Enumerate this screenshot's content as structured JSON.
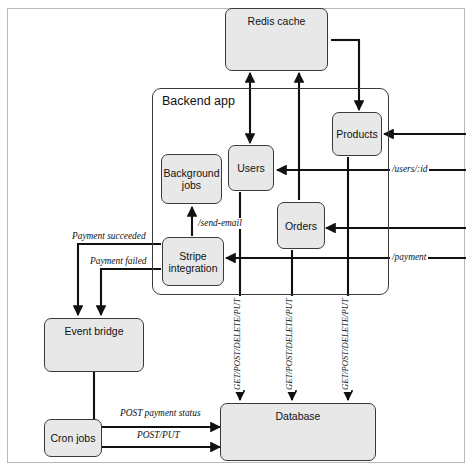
{
  "diagram": {
    "type": "architecture-flow-diagram",
    "colors": {
      "node_fill": "#e8e8e8",
      "node_stroke": "#3a3a3a",
      "edge_stroke": "#111111",
      "frame_stroke": "#b9b9b9",
      "background": "#ffffff"
    },
    "group": {
      "label": "Backend app"
    },
    "nodes": [
      {
        "id": "redis",
        "label": "Redis cache"
      },
      {
        "id": "products",
        "label": "Products"
      },
      {
        "id": "users",
        "label": "Users"
      },
      {
        "id": "orders",
        "label": "Orders"
      },
      {
        "id": "background",
        "label": "Background\njobs",
        "line1": "Background",
        "line2": "jobs"
      },
      {
        "id": "stripe",
        "label": "Stripe\nintegration",
        "line1": "Stripe",
        "line2": "integration"
      },
      {
        "id": "eventbridge",
        "label": "Event bridge"
      },
      {
        "id": "cron",
        "label": "Cron jobs"
      },
      {
        "id": "database",
        "label": "Database"
      }
    ],
    "edge_labels": {
      "users_id": "/users/:id",
      "payment": "/payment",
      "send_email": "/send-email",
      "payment_succeeded": "Payment succeeded",
      "payment_failed": "Payment failed",
      "post_payment_status": "POST payment status",
      "post_put": "POST/PUT",
      "crud_users": "GET/POST/DELETE/PUT",
      "crud_orders": "GET/POST/DELETE/PUT",
      "crud_products": "GET/POST/DELETE/PUT"
    },
    "edges": [
      {
        "from": "redis",
        "to": "users",
        "label": "",
        "bidirectional": true
      },
      {
        "from": "orders",
        "to": "redis",
        "label": "",
        "bidirectional": false
      },
      {
        "from": "redis",
        "to": "products",
        "label": "",
        "bidirectional": false
      },
      {
        "from": "products",
        "to": "redis",
        "label": "",
        "bidirectional": false
      },
      {
        "from": "external",
        "to": "products",
        "label": "",
        "bidirectional": false
      },
      {
        "from": "external",
        "to": "users",
        "label": "/users/:id",
        "bidirectional": false
      },
      {
        "from": "external",
        "to": "orders",
        "label": "",
        "bidirectional": false
      },
      {
        "from": "external",
        "to": "stripe",
        "label": "/payment",
        "bidirectional": false
      },
      {
        "from": "stripe",
        "to": "background",
        "label": "/send-email",
        "bidirectional": false
      },
      {
        "from": "stripe",
        "to": "eventbridge",
        "label": "Payment succeeded",
        "bidirectional": false
      },
      {
        "from": "stripe",
        "to": "eventbridge",
        "label": "Payment failed",
        "bidirectional": false
      },
      {
        "from": "eventbridge",
        "to": "database",
        "label": "POST payment status",
        "bidirectional": false
      },
      {
        "from": "cron",
        "to": "database",
        "label": "POST/PUT",
        "bidirectional": false
      },
      {
        "from": "users",
        "to": "database",
        "label": "GET/POST/DELETE/PUT",
        "bidirectional": false
      },
      {
        "from": "orders",
        "to": "database",
        "label": "GET/POST/DELETE/PUT",
        "bidirectional": false
      },
      {
        "from": "products",
        "to": "database",
        "label": "GET/POST/DELETE/PUT",
        "bidirectional": false
      }
    ]
  }
}
